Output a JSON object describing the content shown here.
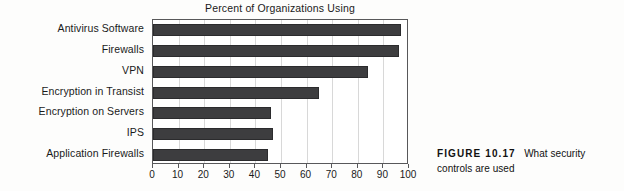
{
  "chart_data": {
    "type": "bar",
    "orientation": "horizontal",
    "title": "Percent of Organizations Using",
    "xlabel": "",
    "ylabel": "",
    "xlim": [
      0,
      100
    ],
    "grid": true,
    "legend": null,
    "categories": [
      "Antivirus Software",
      "Firewalls",
      "VPN",
      "Encryption in Transist",
      "Encryption on Servers",
      "IPS",
      "Application Firewalls"
    ],
    "values": [
      97,
      96,
      84,
      65,
      46,
      47,
      45
    ],
    "xticks": [
      0,
      10,
      20,
      30,
      40,
      50,
      60,
      70,
      80,
      90,
      100
    ],
    "xtick_labels": [
      "0",
      "10",
      "20",
      "30",
      "40",
      "50",
      "60",
      "70",
      "80",
      "90",
      "100"
    ],
    "bar_color": "#3d3d3f",
    "grid_color": "#d8d8d8",
    "axis_color": "#58585a"
  },
  "caption": {
    "label": "FIGURE 10.17",
    "text": "What security controls are used"
  }
}
